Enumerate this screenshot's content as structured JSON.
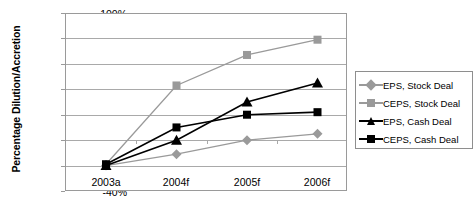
{
  "chart_data": {
    "type": "line",
    "title": "",
    "xlabel": "",
    "ylabel": "Percentage Dilution/Accretion",
    "categories": [
      "2003a",
      "2004f",
      "2005f",
      "2006f"
    ],
    "ylim": [
      -40,
      100
    ],
    "ytick_labels": [
      "100%",
      "80%",
      "60%",
      "40%",
      "20%",
      "0%",
      "-20%",
      "-40%"
    ],
    "ytick_values": [
      100,
      80,
      60,
      40,
      20,
      0,
      -20,
      -40
    ],
    "grid": true,
    "legend_position": "right",
    "series": [
      {
        "name": "EPS, Stock Deal",
        "values": [
          -20,
          -11,
          0,
          5
        ],
        "color": "#9a9a9a",
        "marker": "diamond"
      },
      {
        "name": "CEPS, Stock Deal",
        "values": [
          -19,
          43,
          67,
          79
        ],
        "color": "#9a9a9a",
        "marker": "square"
      },
      {
        "name": "EPS, Cash Deal",
        "values": [
          -20,
          0,
          30,
          45
        ],
        "color": "#000000",
        "marker": "triangle"
      },
      {
        "name": "CEPS, Cash Deal",
        "values": [
          -19,
          10,
          20,
          22
        ],
        "color": "#000000",
        "marker": "square"
      }
    ]
  },
  "colors": {
    "gray_series": "#9a9a9a",
    "black_series": "#000000",
    "gridline": "#a9a9a9",
    "frame": "#9a9a9a",
    "legend_border": "#8e8e8e",
    "background": "#ffffff"
  }
}
